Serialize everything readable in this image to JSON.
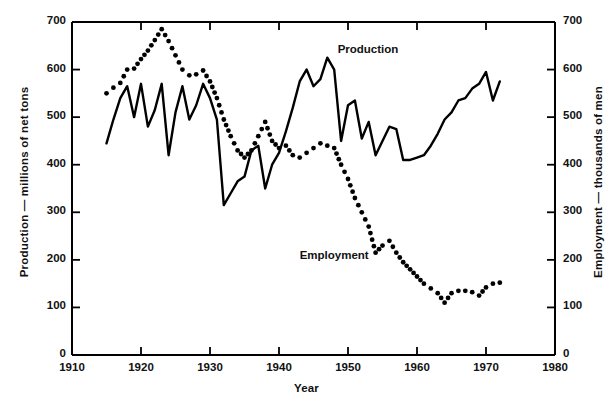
{
  "chart_data": {
    "type": "line",
    "title": "",
    "xlabel": "Year",
    "ylabel": "Production — millions of net tons",
    "y2label": "Employment — thousands of men",
    "xlim": [
      1910,
      1980
    ],
    "ylim": [
      0,
      700
    ],
    "y2lim": [
      0,
      700
    ],
    "grid": false,
    "legend_position": "inline-annotation",
    "x_ticks": [
      1910,
      1920,
      1930,
      1940,
      1950,
      1960,
      1970,
      1980
    ],
    "x_tick_labels": [
      "1910",
      "1920",
      "1930",
      "1940",
      "1950",
      "1960",
      "1970",
      "1980"
    ],
    "y_ticks": [
      0,
      100,
      200,
      300,
      400,
      500,
      600,
      700
    ],
    "y_tick_labels": [
      "0",
      "100",
      "200",
      "300",
      "400",
      "500",
      "600",
      "700"
    ],
    "y2_ticks": [
      0,
      100,
      200,
      300,
      400,
      500,
      600,
      700
    ],
    "y2_tick_labels": [
      "0",
      "100",
      "200",
      "300",
      "400",
      "500",
      "600",
      "700"
    ],
    "annotations": [
      {
        "text": "Production",
        "x": 1948.5,
        "y": 640
      },
      {
        "text": "Employment",
        "x": 1943.0,
        "y": 205
      }
    ],
    "series": [
      {
        "name": "Production",
        "style": "solid",
        "axis": "left",
        "units": "millions of net tons",
        "x": [
          1915,
          1916,
          1917,
          1918,
          1919,
          1920,
          1921,
          1922,
          1923,
          1924,
          1925,
          1926,
          1927,
          1928,
          1929,
          1930,
          1931,
          1932,
          1933,
          1934,
          1935,
          1936,
          1937,
          1938,
          1939,
          1940,
          1941,
          1942,
          1943,
          1944,
          1945,
          1946,
          1947,
          1948,
          1949,
          1950,
          1951,
          1952,
          1953,
          1954,
          1955,
          1956,
          1957,
          1958,
          1959,
          1960,
          1961,
          1962,
          1963,
          1964,
          1965,
          1966,
          1967,
          1968,
          1969,
          1970,
          1971,
          1972
        ],
        "values": [
          445,
          495,
          540,
          565,
          500,
          570,
          480,
          515,
          570,
          420,
          510,
          565,
          495,
          525,
          570,
          540,
          495,
          315,
          340,
          365,
          375,
          430,
          440,
          350,
          400,
          425,
          470,
          520,
          575,
          600,
          565,
          580,
          625,
          600,
          450,
          525,
          535,
          455,
          490,
          420,
          450,
          480,
          475,
          410,
          410,
          415,
          420,
          440,
          465,
          495,
          510,
          535,
          540,
          560,
          570,
          595,
          535,
          575
        ]
      },
      {
        "name": "Employment",
        "style": "dotted",
        "axis": "right",
        "units": "thousands of men",
        "x": [
          1915,
          1916,
          1917,
          1918,
          1919,
          1920,
          1921,
          1922,
          1923,
          1924,
          1925,
          1926,
          1927,
          1928,
          1929,
          1930,
          1931,
          1932,
          1933,
          1934,
          1935,
          1936,
          1937,
          1938,
          1939,
          1940,
          1941,
          1942,
          1943,
          1944,
          1945,
          1946,
          1947,
          1948,
          1949,
          1950,
          1951,
          1952,
          1953,
          1954,
          1955,
          1956,
          1957,
          1958,
          1959,
          1960,
          1961,
          1962,
          1963,
          1964,
          1965,
          1966,
          1967,
          1968,
          1969,
          1970,
          1971,
          1972
        ],
        "values": [
          550,
          562,
          572,
          600,
          602,
          622,
          640,
          662,
          685,
          660,
          630,
          600,
          588,
          590,
          598,
          575,
          540,
          495,
          460,
          430,
          415,
          430,
          460,
          490,
          450,
          435,
          440,
          420,
          415,
          425,
          435,
          445,
          440,
          435,
          400,
          370,
          330,
          300,
          270,
          215,
          230,
          240,
          215,
          195,
          180,
          165,
          150,
          140,
          130,
          110,
          130,
          135,
          135,
          132,
          125,
          142,
          150,
          152
        ]
      }
    ]
  },
  "chart_geometry": {
    "plot_left": 72,
    "plot_right": 555,
    "plot_top": 22,
    "plot_bottom": 355
  }
}
